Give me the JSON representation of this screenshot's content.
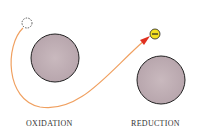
{
  "labels": {
    "left": "OXIDATION",
    "right": "REDUCTION"
  },
  "colors": {
    "sphere_fill": "#c4b3b9",
    "sphere_stroke": "#222222",
    "path": "#f0a060",
    "arrow": "#e03020",
    "electron_fill": "#f2e022"
  },
  "electron_symbol": "−"
}
